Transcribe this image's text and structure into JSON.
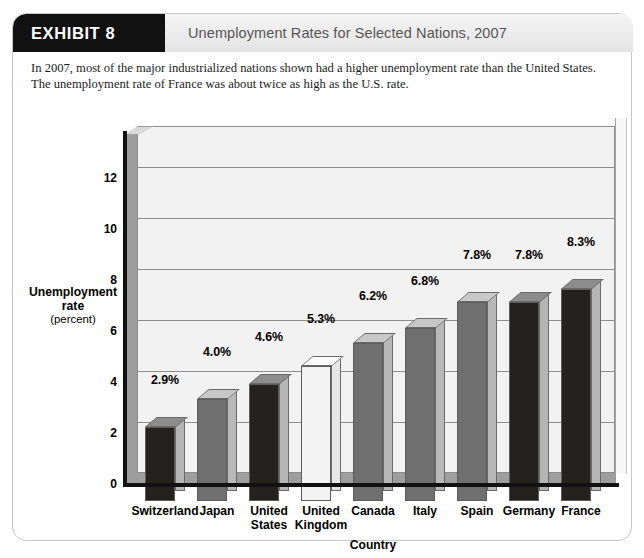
{
  "exhibit": {
    "tag": "EXHIBIT 8",
    "title": "Unemployment Rates for Selected Nations, 2007",
    "caption": "In 2007, most of the major industrialized nations shown had a higher unemployment rate than the United States. The unemployment rate of France was about twice as high as the U.S. rate."
  },
  "axis": {
    "y_title_line1": "Unemployment",
    "y_title_line2": "rate",
    "y_title_line3": "(percent)",
    "x_title": "Country",
    "y_ticks": [
      "0",
      "2",
      "4",
      "6",
      "8",
      "10",
      "12"
    ]
  },
  "colors": {
    "dark_bar": "#23221f",
    "mid_bar": "#6f6f6f",
    "light_bar": "#f3f3f3",
    "header_black": "#111111",
    "header_gray": "#e9e9e9",
    "title_text": "#565656",
    "plot_bg": "#f2f2f2",
    "gridline": "#8d8d8d"
  },
  "chart_data": {
    "type": "bar",
    "title": "Unemployment Rates for Selected Nations, 2007",
    "xlabel": "Country",
    "ylabel": "Unemployment rate (percent)",
    "ylim": [
      0,
      13.6
    ],
    "yticks": [
      0,
      2,
      4,
      6,
      8,
      10,
      12
    ],
    "grid": true,
    "legend": "none",
    "categories": [
      "Switzerland",
      "Japan",
      "United States",
      "United Kingdom",
      "Canada",
      "Italy",
      "Spain",
      "Germany",
      "France"
    ],
    "category_lines": [
      [
        "Switzerland"
      ],
      [
        "Japan"
      ],
      [
        "United",
        "States"
      ],
      [
        "United",
        "Kingdom"
      ],
      [
        "Canada"
      ],
      [
        "Italy"
      ],
      [
        "Spain"
      ],
      [
        "Germany"
      ],
      [
        "France"
      ]
    ],
    "values": [
      2.9,
      4.0,
      4.6,
      5.3,
      6.2,
      6.8,
      7.8,
      7.8,
      8.3
    ],
    "data_labels": [
      "2.9%",
      "4.0%",
      "4.6%",
      "5.3%",
      "6.2%",
      "6.8%",
      "7.8%",
      "7.8%",
      "8.3%"
    ],
    "bar_shades": [
      "dark",
      "mid",
      "dark",
      "light",
      "mid",
      "mid",
      "mid",
      "dark",
      "dark"
    ]
  }
}
